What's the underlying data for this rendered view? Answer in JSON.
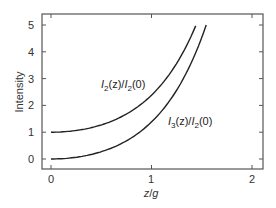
{
  "chart_data": {
    "type": "line",
    "title": "",
    "xlabel": "z/g",
    "ylabel": "Intensity",
    "xlim": [
      0,
      2
    ],
    "ylim": [
      0,
      5
    ],
    "x_ticks": [
      "0",
      "1",
      "2"
    ],
    "y_ticks": [
      "0",
      "1",
      "2",
      "3",
      "4",
      "5"
    ],
    "grid": false,
    "legend": "none (inline curve annotations)",
    "series": [
      {
        "name": "I2(z)/I2(0)",
        "x": [
          0,
          0.2,
          0.4,
          0.6,
          0.8,
          1.0,
          1.2,
          1.4,
          1.44
        ],
        "values": [
          1.0,
          1.04,
          1.17,
          1.41,
          1.79,
          2.38,
          3.29,
          4.69,
          5.0
        ]
      },
      {
        "name": "I3(z)/I2(0)",
        "x": [
          0,
          0.2,
          0.4,
          0.6,
          0.8,
          1.0,
          1.2,
          1.4,
          1.55
        ],
        "values": [
          0.0,
          0.04,
          0.17,
          0.41,
          0.79,
          1.38,
          2.29,
          3.69,
          5.0
        ]
      }
    ],
    "annotations": [
      {
        "text": "I2(z)/I2(0)",
        "x": 0.55,
        "y": 2.75
      },
      {
        "text": "I3(z)/I2(0)",
        "x": 1.25,
        "y": 1.35
      }
    ]
  },
  "labels": {
    "xlabel_main": "z",
    "xlabel_sep": "/",
    "xlabel_den": "g",
    "ylabel": "Intensity",
    "ann1": {
      "I": "I",
      "sub1": "2",
      "mid": "(z)/",
      "I2": "I",
      "sub2": "2",
      "end": "(0)"
    },
    "ann2": {
      "I": "I",
      "sub1": "3",
      "mid": "(z)/",
      "I2": "I",
      "sub2": "2",
      "end": "(0)"
    },
    "xticks": [
      "0",
      "1",
      "2"
    ],
    "yticks": [
      "0",
      "1",
      "2",
      "3",
      "4",
      "5"
    ]
  }
}
